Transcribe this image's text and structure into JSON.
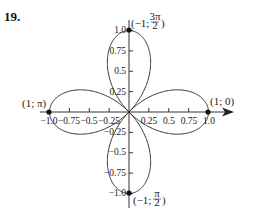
{
  "problem_number": "19.",
  "chart_data": {
    "type": "line",
    "title": "",
    "equation": "r = cos(2θ)",
    "xlabel": "",
    "ylabel": "",
    "xlim": [
      -1.0,
      1.0
    ],
    "ylim": [
      -1.0,
      1.0
    ],
    "grid": false,
    "x_ticks": [
      "-1.0",
      "-0.75",
      "-0.5",
      "-0.25",
      "0.25",
      "0.5",
      "0.75",
      "1.0"
    ],
    "y_ticks": [
      "1.0",
      "0.75",
      "0.5",
      "0.25",
      "-0.25",
      "-0.5",
      "-0.75",
      "-1.0"
    ],
    "marked_points": [
      {
        "label": "(1; 0)",
        "x": 1.0,
        "y": 0.0
      },
      {
        "label": "(1; π)",
        "x": -1.0,
        "y": 0.0
      },
      {
        "label": "(−1; 3π/2)",
        "x": 0.0,
        "y": 1.0
      },
      {
        "label": "(−1; π/2)",
        "x": 0.0,
        "y": -1.0
      }
    ]
  },
  "labels": {
    "p_right": "(1; 0)",
    "p_left": "(1; π)",
    "p_top_prefix": "(−1; ",
    "p_top_num": "3π",
    "p_top_den": "2",
    "p_bottom_prefix": "(−1; ",
    "p_bottom_num": "π",
    "p_bottom_den": "2",
    "close_paren": ")",
    "x_ticks": [
      "−1.0",
      "−0.75",
      "−0.5",
      "−0.25",
      "0.25",
      "0.5",
      "0.75",
      "1.0"
    ],
    "y_ticks": [
      "1.0",
      "0.75",
      "0.5",
      "0.25",
      "−0.25",
      "−0.5",
      "−0.75",
      "−1.0"
    ]
  }
}
